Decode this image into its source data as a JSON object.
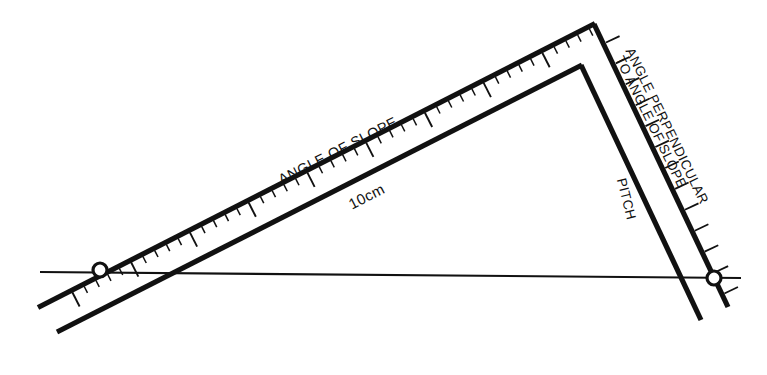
{
  "figure": {
    "background_color": "#ffffff",
    "line_color": "#111111"
  },
  "labels": {
    "angle_of_slope": "ANGLE OF SLOPE",
    "scale_length": "10cm",
    "pitch": "PITCH",
    "angle_perpendicular_line1": "ANGLE PERPENDICULAR",
    "angle_perpendicular_line2": "TO ANGLE OF SLOPE"
  },
  "elements": {
    "horizontal_reference_line": "horizontal reference line",
    "left_pivot": "left pivot point",
    "right_pivot": "right pivot point",
    "slope_arm": "graduated slope arm",
    "pitch_arm": "graduated pitch arm",
    "apex": "apex vertex"
  },
  "chart_data": {
    "type": "diagram",
    "geometry": {
      "horizontal_line": {
        "x1": 40,
        "y1": 272,
        "x2": 741,
        "y2": 278
      },
      "slope_outer_edge": {
        "x1": 38,
        "y1": 307,
        "x2": 594,
        "y2": 24
      },
      "slope_inner_edge": {
        "x1": 57,
        "y1": 332,
        "x2": 581,
        "y2": 65
      },
      "pitch_outer_edge": {
        "x1": 594,
        "y1": 24,
        "x2": 727,
        "y2": 306
      },
      "pitch_inner_edge": {
        "x1": 581,
        "y1": 65,
        "x2": 700,
        "y2": 319
      },
      "left_pivot": {
        "cx": 100,
        "cy": 270,
        "r": 7
      },
      "right_pivot": {
        "cx": 714,
        "cy": 278,
        "r": 7
      }
    },
    "graduations": {
      "slope_arm_minor_count": 44,
      "slope_arm_major_every": 5,
      "pitch_arm_tick_count": 12
    }
  }
}
